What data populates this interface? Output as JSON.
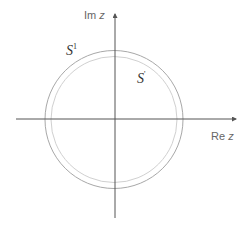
{
  "diagram": {
    "title": "",
    "axes": {
      "real_label_prefix": "Re",
      "real_label_var": "z",
      "imag_label_prefix": "Im",
      "imag_label_var": "z",
      "color": "#666666"
    },
    "curves": [
      {
        "name": "outer-circle",
        "label_base": "S",
        "label_sup": "1",
        "radius_px": 69,
        "color": "#aaaaaa"
      },
      {
        "name": "inner-circle",
        "label_base": "S",
        "label_sup": "'",
        "radius_px": 63,
        "color": "#cccccc"
      }
    ]
  }
}
